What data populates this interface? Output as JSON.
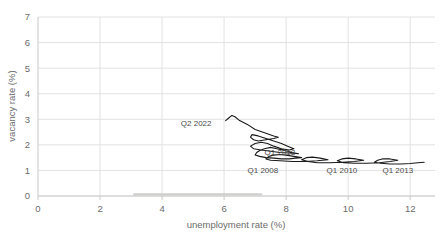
{
  "chart_data": {
    "type": "line",
    "title": "",
    "xlabel": "unemployment rate (%)",
    "ylabel": "vacancy rate (%)",
    "xlim": [
      0,
      12.8
    ],
    "ylim": [
      0,
      7
    ],
    "xticks": [
      "0",
      "2",
      "4",
      "6",
      "8",
      "10",
      "12"
    ],
    "xtick_values": [
      0,
      2,
      4,
      6,
      8,
      10,
      12
    ],
    "yticks": [
      "0",
      "1",
      "2",
      "3",
      "4",
      "5",
      "6",
      "7"
    ],
    "ytick_values": [
      0,
      1,
      2,
      3,
      4,
      5,
      6,
      7
    ],
    "grid": true,
    "legend": "none",
    "series_name": "Beveridge curve",
    "line_color": "#1a1a1a",
    "grid_color": "#e2e2e2",
    "axis_color": "#c9c9c9",
    "x": [
      6.05,
      6.15,
      6.25,
      6.35,
      6.5,
      6.75,
      7.0,
      7.35,
      7.6,
      7.75,
      7.6,
      7.35,
      7.1,
      6.95,
      6.85,
      6.9,
      7.1,
      7.35,
      7.6,
      7.85,
      8.05,
      8.25,
      8.1,
      7.85,
      7.6,
      7.4,
      7.2,
      7.0,
      6.85,
      6.95,
      7.2,
      7.5,
      7.8,
      8.1,
      8.4,
      8.2,
      7.95,
      7.7,
      7.5,
      7.3,
      7.15,
      7.05,
      7.0,
      7.15,
      7.35,
      7.6,
      7.85,
      8.1,
      8.3,
      8.5,
      8.25,
      8.0,
      7.8,
      7.6,
      7.45,
      7.35,
      7.5,
      7.8,
      8.2,
      8.6,
      9.0,
      9.35,
      9.1,
      8.85,
      8.65,
      8.5,
      8.7,
      9.0,
      9.4,
      9.8,
      10.2,
      10.5,
      10.25,
      10.0,
      9.8,
      9.65,
      9.85,
      10.2,
      10.6,
      11.0,
      11.35,
      11.6,
      11.35,
      11.1,
      10.95,
      10.85,
      11.05,
      11.35,
      11.7,
      12.0,
      12.25,
      12.45
    ],
    "y": [
      2.95,
      3.05,
      3.15,
      3.1,
      2.95,
      2.8,
      2.6,
      2.45,
      2.35,
      2.3,
      2.25,
      2.2,
      2.15,
      2.2,
      2.3,
      2.4,
      2.35,
      2.25,
      2.15,
      2.05,
      1.95,
      1.85,
      1.8,
      1.85,
      1.95,
      2.05,
      2.1,
      2.05,
      1.95,
      1.85,
      1.8,
      1.75,
      1.7,
      1.68,
      1.65,
      1.7,
      1.78,
      1.85,
      1.9,
      1.85,
      1.78,
      1.7,
      1.6,
      1.55,
      1.5,
      1.48,
      1.45,
      1.45,
      1.48,
      1.5,
      1.55,
      1.6,
      1.62,
      1.6,
      1.55,
      1.45,
      1.4,
      1.38,
      1.35,
      1.35,
      1.38,
      1.42,
      1.48,
      1.52,
      1.5,
      1.42,
      1.35,
      1.3,
      1.3,
      1.32,
      1.35,
      1.4,
      1.45,
      1.48,
      1.45,
      1.38,
      1.3,
      1.28,
      1.28,
      1.3,
      1.35,
      1.4,
      1.45,
      1.45,
      1.4,
      1.32,
      1.28,
      1.25,
      1.25,
      1.27,
      1.3,
      1.32
    ],
    "annotations": [
      {
        "label": "Q2 2022",
        "x": 5.1,
        "y": 2.72,
        "anchor": "middle"
      },
      {
        "label": "Q1 2018",
        "x": 7.8,
        "y": 1.62,
        "anchor": "middle"
      },
      {
        "label": "Q1 2008",
        "x": 7.25,
        "y": 0.88,
        "anchor": "middle"
      },
      {
        "label": "Q1 2010",
        "x": 9.8,
        "y": 0.88,
        "anchor": "middle"
      },
      {
        "label": "Q1 2013",
        "x": 11.6,
        "y": 0.88,
        "anchor": "middle"
      }
    ],
    "baseline_smudge": {
      "x_start": 3.1,
      "x_end": 7.2,
      "y": 0.06
    }
  }
}
